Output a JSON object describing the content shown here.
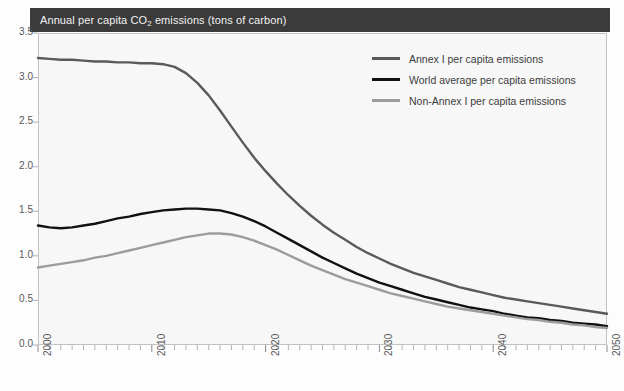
{
  "banner": {
    "title_prefix": "Annual per capita CO",
    "title_sub": "2",
    "title_suffix": " emissions (tons of carbon)",
    "background_color": "#3b3b3b",
    "text_color": "#f2f2f2"
  },
  "legend": {
    "position": "top-right-inside",
    "entries": [
      {
        "label": "Annex I per capita emissions",
        "color": "#5a5a5a"
      },
      {
        "label": "World average per capita emissions",
        "color": "#111111"
      },
      {
        "label": "Non-Annex I per capita emissions",
        "color": "#9c9c9c"
      }
    ]
  },
  "chart_data": {
    "type": "line",
    "title": "Annual per capita CO2 emissions (tons of carbon)",
    "xlabel": "",
    "ylabel": "",
    "xlim": [
      2000,
      2050
    ],
    "ylim": [
      0.0,
      3.5
    ],
    "grid": false,
    "legend_position": "upper right",
    "y_ticks": [
      "0.0",
      "0.5",
      "1.0",
      "1.5",
      "2.0",
      "2.5",
      "3.0",
      "3.5"
    ],
    "y_tick_values": [
      0.0,
      0.5,
      1.0,
      1.5,
      2.0,
      2.5,
      3.0,
      3.5
    ],
    "x_ticks": [
      "2000",
      "2010",
      "2020",
      "2030",
      "2040",
      "2050"
    ],
    "x_tick_values": [
      2000,
      2010,
      2020,
      2030,
      2040,
      2050
    ],
    "x_minor_tick_interval": 1,
    "x": [
      2000,
      2001,
      2002,
      2003,
      2004,
      2005,
      2006,
      2007,
      2008,
      2009,
      2010,
      2011,
      2012,
      2013,
      2014,
      2015,
      2016,
      2017,
      2018,
      2019,
      2020,
      2021,
      2022,
      2023,
      2024,
      2025,
      2026,
      2027,
      2028,
      2029,
      2030,
      2031,
      2032,
      2033,
      2034,
      2035,
      2036,
      2037,
      2038,
      2039,
      2040,
      2041,
      2042,
      2043,
      2044,
      2045,
      2046,
      2047,
      2048,
      2049,
      2050
    ],
    "series": [
      {
        "name": "Annex I per capita emissions",
        "color": "#5a5a5a",
        "values": [
          3.22,
          3.21,
          3.2,
          3.2,
          3.19,
          3.18,
          3.18,
          3.17,
          3.17,
          3.16,
          3.16,
          3.15,
          3.12,
          3.05,
          2.94,
          2.8,
          2.63,
          2.45,
          2.27,
          2.1,
          1.95,
          1.81,
          1.68,
          1.56,
          1.45,
          1.35,
          1.26,
          1.18,
          1.1,
          1.03,
          0.97,
          0.91,
          0.86,
          0.81,
          0.77,
          0.73,
          0.69,
          0.65,
          0.62,
          0.59,
          0.56,
          0.53,
          0.51,
          0.49,
          0.47,
          0.45,
          0.43,
          0.41,
          0.39,
          0.37,
          0.35
        ]
      },
      {
        "name": "World average per capita emissions",
        "color": "#111111",
        "values": [
          1.34,
          1.32,
          1.31,
          1.32,
          1.34,
          1.36,
          1.39,
          1.42,
          1.44,
          1.47,
          1.49,
          1.51,
          1.52,
          1.53,
          1.53,
          1.52,
          1.51,
          1.48,
          1.44,
          1.39,
          1.33,
          1.26,
          1.19,
          1.12,
          1.05,
          0.98,
          0.92,
          0.86,
          0.8,
          0.75,
          0.7,
          0.66,
          0.62,
          0.58,
          0.54,
          0.51,
          0.48,
          0.45,
          0.42,
          0.4,
          0.38,
          0.35,
          0.33,
          0.31,
          0.3,
          0.28,
          0.27,
          0.25,
          0.24,
          0.23,
          0.21
        ]
      },
      {
        "name": "Non-Annex I per capita emissions",
        "color": "#9c9c9c",
        "values": [
          0.87,
          0.89,
          0.91,
          0.93,
          0.95,
          0.98,
          1.0,
          1.03,
          1.06,
          1.09,
          1.12,
          1.15,
          1.18,
          1.21,
          1.23,
          1.25,
          1.25,
          1.24,
          1.21,
          1.17,
          1.12,
          1.07,
          1.01,
          0.95,
          0.89,
          0.84,
          0.79,
          0.74,
          0.7,
          0.66,
          0.62,
          0.58,
          0.55,
          0.52,
          0.49,
          0.46,
          0.43,
          0.41,
          0.39,
          0.37,
          0.35,
          0.33,
          0.31,
          0.29,
          0.28,
          0.26,
          0.25,
          0.23,
          0.22,
          0.2,
          0.19
        ]
      }
    ]
  }
}
